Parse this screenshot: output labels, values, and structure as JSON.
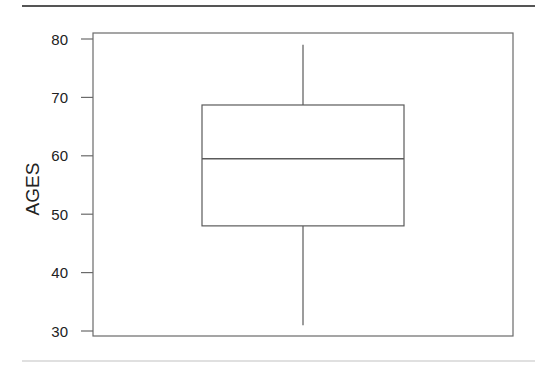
{
  "chart_data": {
    "type": "boxplot",
    "title": "",
    "xlabel": "",
    "ylabel": "AGES",
    "ylim": [
      29,
      81
    ],
    "yticks": [
      30,
      40,
      50,
      60,
      70,
      80
    ],
    "ytick_labels": [
      "30",
      "40",
      "50",
      "60",
      "70",
      "80"
    ],
    "grid": false,
    "legend": null,
    "series": [
      {
        "name": "AGES",
        "min": 31,
        "q1": 48,
        "median": 59.5,
        "q3": 68.7,
        "max": 79
      }
    ]
  }
}
